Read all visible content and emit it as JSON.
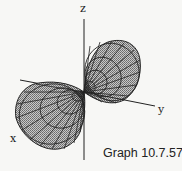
{
  "figure": {
    "caption": "Graph 10.7.57",
    "type": "3d-surface",
    "axes": {
      "x_label": "x",
      "y_label": "y",
      "z_label": "z"
    },
    "colors": {
      "surface_fill": "#a8a8a8",
      "mesh_lines": "#222222",
      "axes": "#222222",
      "background": "#f7f7f5"
    }
  }
}
